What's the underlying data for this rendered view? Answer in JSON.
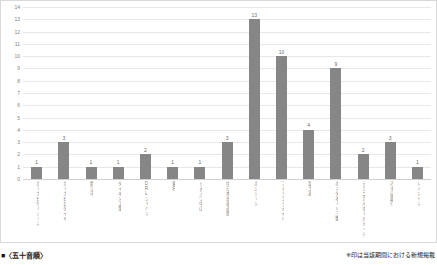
{
  "chart_data": {
    "type": "bar",
    "title": "",
    "xlabel": "",
    "ylabel": "",
    "ylim": [
      0,
      14
    ],
    "ytick_step": 1,
    "grid": true,
    "legend": "none",
    "bar_color": "#868686",
    "categories": [
      "カーナビゲーション",
      "カーナビとタイヤ",
      "静江市",
      "ダイキン工業",
      "DRLジャパン",
      "東名",
      "トヌスワ中山",
      "中日本高速道路",
      "ポジション",
      "フォーラーデイト",
      "富士通",
      "ホンダオート三重",
      "テクニカルホールディングス",
      "みずほ銀行",
      "レミントン"
    ],
    "values": [
      1,
      3,
      1,
      1,
      2,
      1,
      1,
      3,
      13,
      10,
      4,
      9,
      2,
      3,
      1
    ],
    "yticks": [
      "0",
      "1",
      "2",
      "3",
      "4",
      "5",
      "6",
      "7",
      "8",
      "9",
      "10",
      "11",
      "12",
      "13",
      "14"
    ]
  },
  "footer": {
    "left_text": "■〈五十音順〉",
    "right_text": "※印は当該期間における新規掲載"
  }
}
